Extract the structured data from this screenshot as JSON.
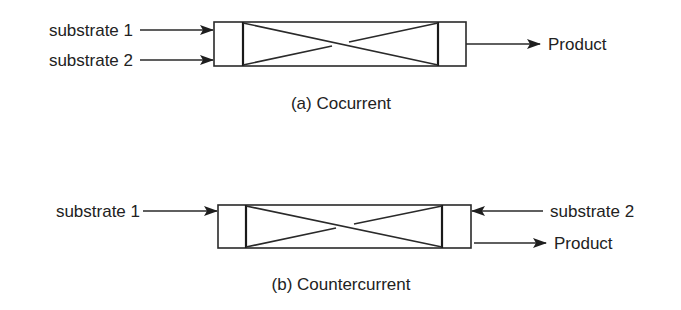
{
  "diagram_a": {
    "caption": "(a) Cocurrent",
    "inputs": [
      {
        "label": "substrate 1",
        "direction": "right"
      },
      {
        "label": "substrate 2",
        "direction": "right"
      }
    ],
    "output": {
      "label": "Product",
      "direction": "right"
    }
  },
  "diagram_b": {
    "caption": "(b) Countercurrent",
    "inputs": [
      {
        "label": "substrate 1",
        "direction": "right"
      },
      {
        "label": "substrate 2",
        "direction": "left"
      }
    ],
    "output": {
      "label": "Product",
      "direction": "right"
    }
  },
  "colors": {
    "line": "#2a2a2a",
    "text": "#222222",
    "background": "#ffffff"
  }
}
